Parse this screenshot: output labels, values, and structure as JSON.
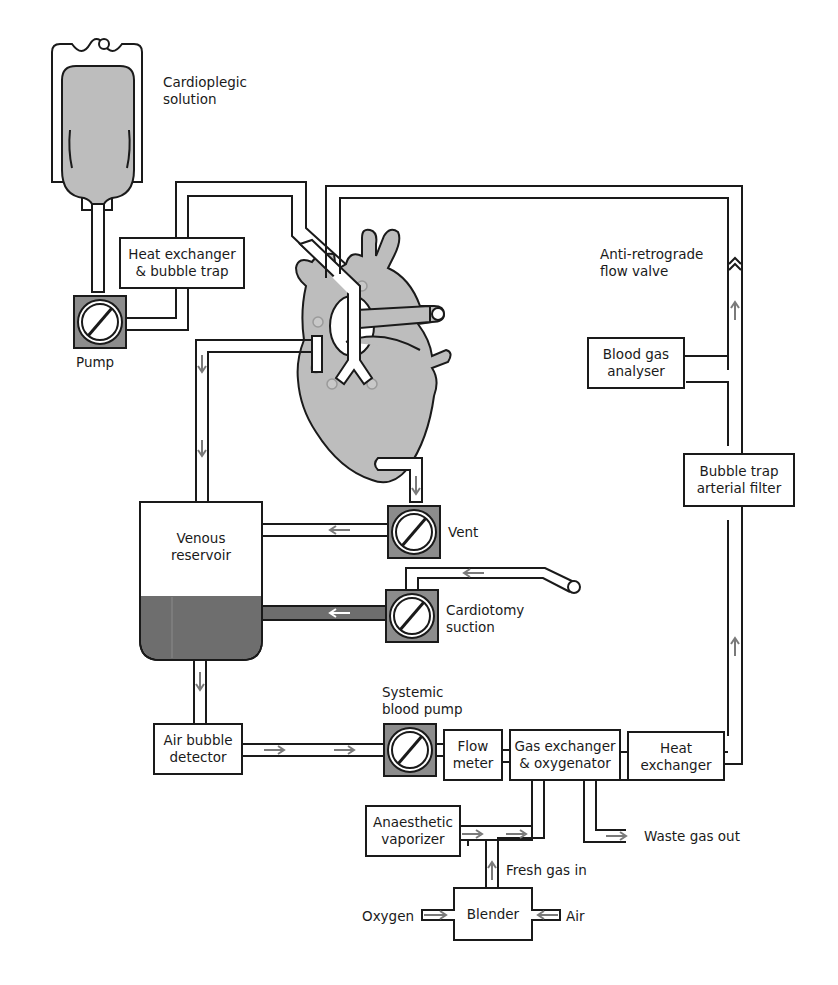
{
  "diagram": {
    "colors": {
      "line": "#1a1a1a",
      "organ_fill": "#bdbdbd",
      "pump_square": "#8c8c8c",
      "blood_fill": "#6e6e6e",
      "arrow": "#7a7a7a",
      "background": "#ffffff"
    },
    "labels": {
      "cardioplegic": "Cardioplegic\nsolution",
      "heat_exchanger_bubble_trap": "Heat exchanger\n& bubble trap",
      "pump": "Pump",
      "anti_retrograde": "Anti-retrograde\nflow valve",
      "blood_gas_analyser": "Blood gas\nanalyser",
      "bubble_trap_filter": "Bubble trap\narterial filter",
      "venous_reservoir": "Venous\nreservoir",
      "vent": "Vent",
      "cardiotomy_suction": "Cardiotomy\nsuction",
      "systemic_pump": "Systemic\nblood pump",
      "air_bubble_detector": "Air bubble\ndetector",
      "flow_meter": "Flow\nmeter",
      "gas_exchanger": "Gas exchanger\n& oxygenator",
      "heat_exchanger": "Heat\nexchanger",
      "waste_gas": "Waste gas out",
      "anaesthetic_vaporizer": "Anaesthetic\nvaporizer",
      "fresh_gas": "Fresh gas in",
      "blender": "Blender",
      "oxygen": "Oxygen",
      "air": "Air"
    },
    "nodes": [
      {
        "id": "cardioplegic-bag",
        "type": "reservoir-bag"
      },
      {
        "id": "cardioplegia-pump",
        "type": "roller-pump"
      },
      {
        "id": "heat-exchanger-bubble-trap",
        "type": "box"
      },
      {
        "id": "heart",
        "type": "organ"
      },
      {
        "id": "vent-pump",
        "type": "roller-pump"
      },
      {
        "id": "cardiotomy-pump",
        "type": "roller-pump"
      },
      {
        "id": "venous-reservoir",
        "type": "reservoir"
      },
      {
        "id": "air-bubble-detector",
        "type": "box"
      },
      {
        "id": "systemic-pump",
        "type": "roller-pump"
      },
      {
        "id": "flow-meter",
        "type": "box"
      },
      {
        "id": "gas-exchanger",
        "type": "box"
      },
      {
        "id": "heat-exchanger",
        "type": "box"
      },
      {
        "id": "bubble-trap-filter",
        "type": "box"
      },
      {
        "id": "blood-gas-analyser",
        "type": "box"
      },
      {
        "id": "anti-retrograde-valve",
        "type": "valve"
      },
      {
        "id": "anaesthetic-vaporizer",
        "type": "box"
      },
      {
        "id": "blender",
        "type": "box"
      }
    ]
  }
}
